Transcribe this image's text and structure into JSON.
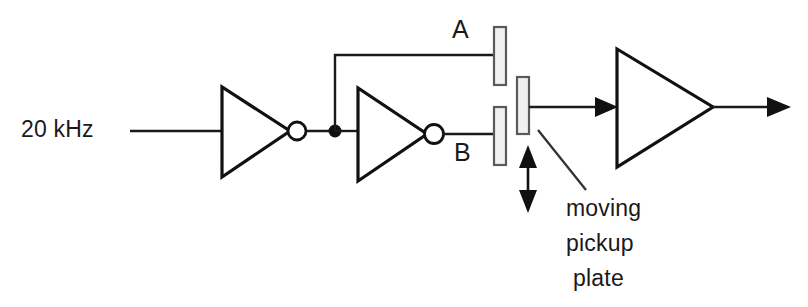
{
  "diagram": {
    "background_color": "#ffffff",
    "line_color": "#1a1a1a",
    "plate_fill_color": "#f0f0f0",
    "plate_stroke_color": "#5a5a5a",
    "labels": {
      "input_frequency": "20 kHz",
      "plate_a": "A",
      "plate_b": "B",
      "annotation_line_1": "moving",
      "annotation_line_2": "pickup",
      "annotation_line_3": "plate"
    },
    "components": [
      {
        "name": "input-wire",
        "type": "wire"
      },
      {
        "name": "inverter-1",
        "type": "inverter-gate"
      },
      {
        "name": "junction-node",
        "type": "junction"
      },
      {
        "name": "branch-wire-top",
        "type": "wire"
      },
      {
        "name": "inverter-2",
        "type": "inverter-gate"
      },
      {
        "name": "plate-a",
        "type": "capacitor-plate"
      },
      {
        "name": "plate-b",
        "type": "capacitor-plate"
      },
      {
        "name": "moving-pickup-plate",
        "type": "capacitor-plate"
      },
      {
        "name": "motion-arrow",
        "type": "double-arrow"
      },
      {
        "name": "amplifier",
        "type": "amplifier-triangle"
      },
      {
        "name": "output-wire",
        "type": "wire"
      }
    ]
  }
}
